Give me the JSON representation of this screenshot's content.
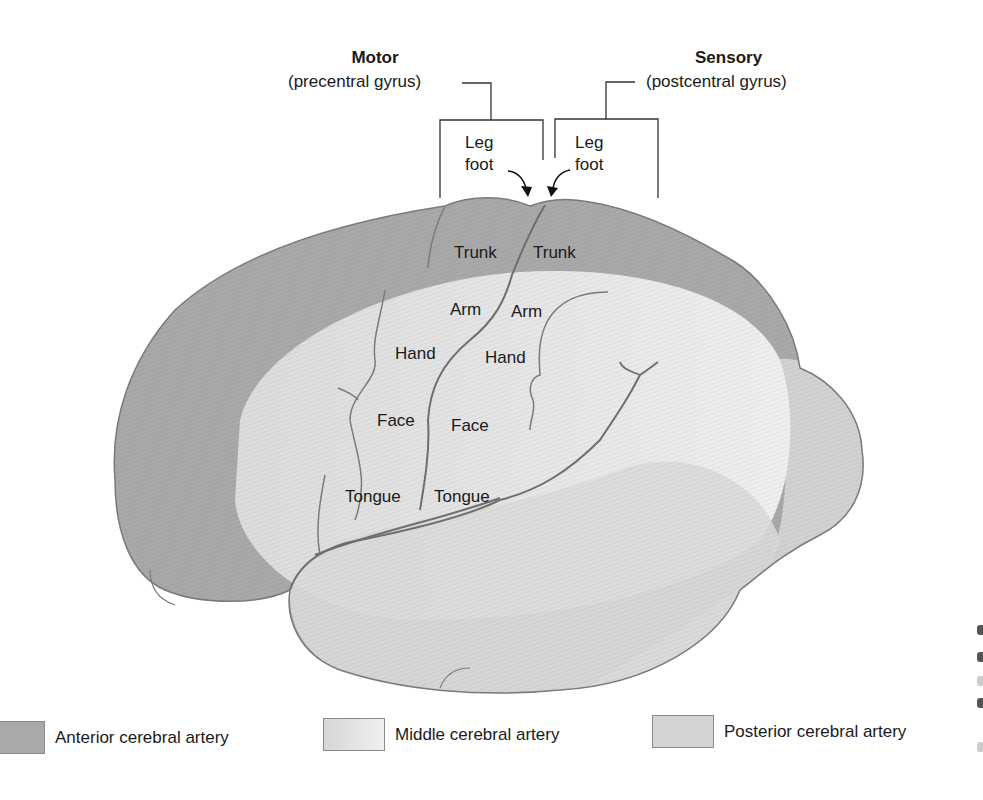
{
  "diagram": {
    "title_motor": "Motor",
    "subtitle_motor": "(precentral gyrus)",
    "title_sensory": "Sensory",
    "subtitle_sensory": "(postcentral gyrus)",
    "motor_labels": {
      "leg": "Leg",
      "foot": "foot",
      "trunk": "Trunk",
      "arm": "Arm",
      "hand": "Hand",
      "face": "Face",
      "tongue": "Tongue"
    },
    "sensory_labels": {
      "leg": "Leg",
      "foot": "foot",
      "trunk": "Trunk",
      "arm": "Arm",
      "hand": "Hand",
      "face": "Face",
      "tongue": "Tongue"
    },
    "colors": {
      "anterior": "#a9a9a9",
      "middle": "#e4e4e4",
      "posterior": "#d2d2d2",
      "outline": "#777777",
      "sulcus": "#6e6e6e"
    }
  },
  "legend": {
    "items": [
      {
        "label": "Anterior cerebral artery",
        "color": "#a9a9a9"
      },
      {
        "label": "Middle cerebral artery",
        "color": "#e2e2e2"
      },
      {
        "label": "Posterior cerebral artery",
        "color": "#d4d4d4"
      }
    ]
  }
}
